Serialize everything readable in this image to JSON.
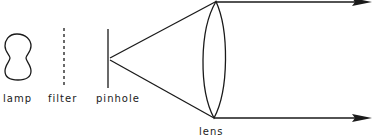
{
  "diagram": {
    "type": "optical-setup",
    "colors": {
      "stroke": "#1a1a1a",
      "background": "#ffffff"
    },
    "components": [
      {
        "id": "lamp",
        "label": "lamp"
      },
      {
        "id": "filter",
        "label": "filter"
      },
      {
        "id": "pinhole",
        "label": "pinhole"
      },
      {
        "id": "lens",
        "label": "lens"
      }
    ],
    "rays": [
      {
        "from": "pinhole",
        "to": "lens-top"
      },
      {
        "from": "pinhole",
        "to": "lens-bottom"
      },
      {
        "from": "lens-top",
        "to": "output-top",
        "arrow": true
      },
      {
        "from": "lens-bottom",
        "to": "output-bottom",
        "arrow": true
      }
    ]
  }
}
